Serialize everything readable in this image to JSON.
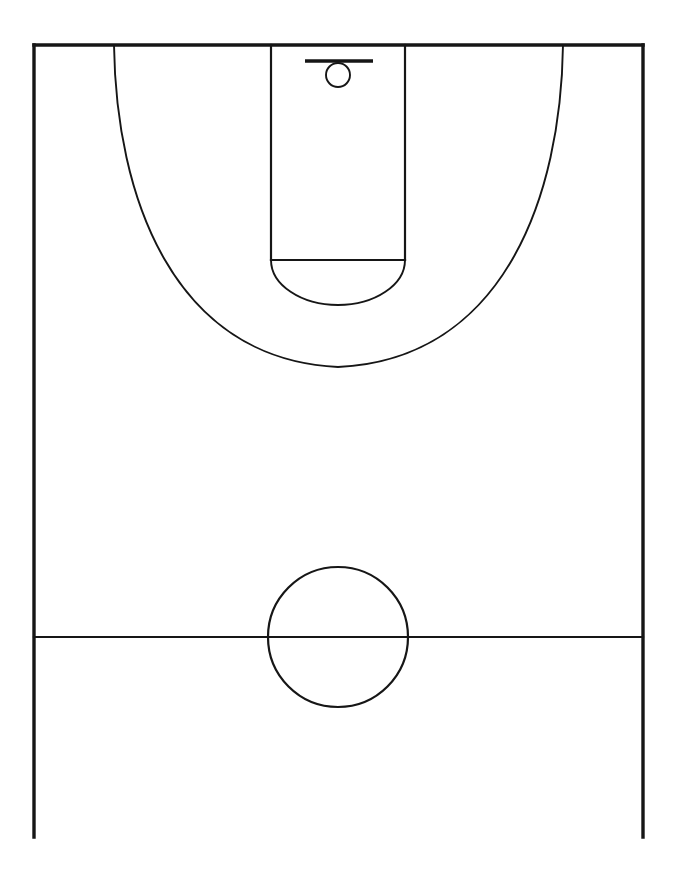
{
  "diagram": {
    "kind": "line-drawing",
    "background_color": "#ffffff",
    "line_color": "#161616",
    "canvas": {
      "width": 676,
      "height": 878
    },
    "labels_present": false,
    "text_present": false
  },
  "court": {
    "type": "half-court",
    "orientation": "vertical",
    "baseline": {
      "name": "baseline",
      "y": 45,
      "x_start": 34,
      "x_end": 643,
      "stroke_width": 3.4
    },
    "left_sideline": {
      "name": "left-sideline",
      "x": 34,
      "y_start": 45,
      "y_end": 837,
      "stroke_width": 3.4
    },
    "right_sideline": {
      "name": "right-sideline",
      "x": 643,
      "y_start": 45,
      "y_end": 837,
      "stroke_width": 3.4
    },
    "half_court_line": {
      "name": "half-court-line",
      "y": 637,
      "x_start": 34,
      "x_end": 643,
      "stroke_width": 2.2
    },
    "bottom_open": true
  },
  "center_circle": {
    "name": "center-circle",
    "cx": 338,
    "cy": 637,
    "r": 70,
    "stroke_width": 2.2
  },
  "key": {
    "name": "free-throw-lane",
    "left_x": 271,
    "right_x": 405,
    "top_y": 45,
    "bottom_y": 260,
    "width": 134,
    "height": 215,
    "stroke_width": 2.2
  },
  "free_throw_line": {
    "name": "free-throw-line",
    "y": 260,
    "x_start": 271,
    "x_end": 405,
    "stroke_width": 2.6
  },
  "free_throw_circle": {
    "name": "free-throw-circle-lower-arc",
    "cx": 338,
    "cy": 260,
    "r": 67,
    "arc": "lower-semicircle",
    "bottom_y": 305,
    "stroke_width": 2.0
  },
  "three_point_arc": {
    "name": "three-point-arc",
    "left_corner_x": 114,
    "right_corner_x": 563,
    "baseline_y": 45,
    "apex_y": 367,
    "apex_x": 338,
    "stroke_width": 2.0
  },
  "backboard": {
    "name": "backboard",
    "y": 61,
    "x_start": 305,
    "x_end": 373,
    "width": 68,
    "stroke_width": 3.6
  },
  "rim": {
    "name": "rim",
    "cx": 338,
    "cy": 75,
    "r": 12,
    "stroke_width": 2.0
  }
}
